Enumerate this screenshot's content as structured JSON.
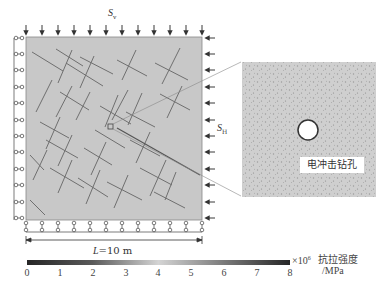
{
  "diagram": {
    "vertical_stress_label": {
      "symbol": "S",
      "subscript": "v"
    },
    "horizontal_stress_label": {
      "symbol": "S",
      "subscript": "H"
    },
    "dimension_label": {
      "symbol": "L",
      "text": "=10 m"
    },
    "inset_label": "电冲击钻孔",
    "top_arrow_count": 12,
    "right_arrow_count": 12,
    "left_roller_count": 12,
    "bottom_roller_count": 12
  },
  "colorbar": {
    "ticks": [
      "0",
      "1",
      "2",
      "3",
      "4",
      "5",
      "6",
      "7",
      "8"
    ],
    "multiplier": "×10",
    "multiplier_exp": "6",
    "title": "抗拉强度",
    "unit": "/MPa",
    "range": [
      0,
      8
    ],
    "color_start": "#2a2a2a",
    "color_mid": "#cfcfcf",
    "color_end": "#2a2a2a"
  },
  "colors": {
    "domain_fill": "#c9c9c9",
    "fracture": "#6e6e6e",
    "inset_fill": "#cdcdcd",
    "stroke": "#444444"
  }
}
